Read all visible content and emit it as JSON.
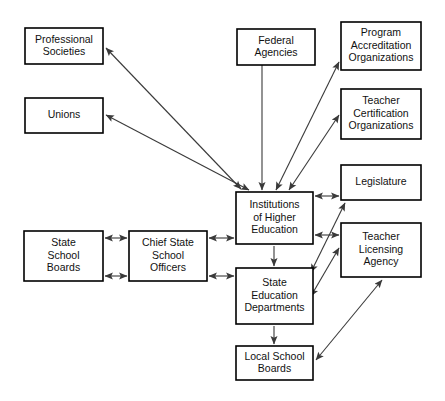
{
  "diagram": {
    "background_color": "#ffffff",
    "box_fill": "#ffffff",
    "box_stroke": "#000000",
    "edge_color": "#3a3a3a",
    "nodes": [
      {
        "id": "professional-societies",
        "label": "Professional Societies",
        "lines": [
          "Professional",
          "Societies"
        ],
        "x": 25,
        "y": 28,
        "w": 78,
        "h": 36
      },
      {
        "id": "unions",
        "label": "Unions",
        "lines": [
          "Unions"
        ],
        "x": 25,
        "y": 98,
        "w": 78,
        "h": 35
      },
      {
        "id": "federal-agencies",
        "label": "Federal Agencies",
        "lines": [
          "Federal",
          "Agencies"
        ],
        "x": 237,
        "y": 29,
        "w": 78,
        "h": 36
      },
      {
        "id": "program-accreditation-organizations",
        "label": "Program Accreditation Organizations",
        "lines": [
          "Program",
          "Accreditation",
          "Organizations"
        ],
        "x": 341,
        "y": 22,
        "w": 80,
        "h": 48
      },
      {
        "id": "teacher-certification-organizations",
        "label": "Teacher Certification Organizations",
        "lines": [
          "Teacher",
          "Certification",
          "Organizations"
        ],
        "x": 341,
        "y": 89,
        "w": 80,
        "h": 50
      },
      {
        "id": "legislature",
        "label": "Legislature",
        "lines": [
          "Legislature"
        ],
        "x": 341,
        "y": 165,
        "w": 80,
        "h": 35
      },
      {
        "id": "teacher-licensing-agency",
        "label": "Teacher Licensing Agency",
        "lines": [
          "Teacher",
          "Licensing",
          "Agency"
        ],
        "x": 341,
        "y": 223,
        "w": 80,
        "h": 54
      },
      {
        "id": "institutions-of-higher-education",
        "label": "Institutions of Higher Education",
        "lines": [
          "Institutions",
          "of Higher",
          "Education"
        ],
        "x": 236,
        "y": 192,
        "w": 77,
        "h": 52
      },
      {
        "id": "state-education-departments",
        "label": "State Education Departments",
        "lines": [
          "State",
          "Education",
          "Departments"
        ],
        "x": 236,
        "y": 268,
        "w": 77,
        "h": 56
      },
      {
        "id": "local-school-boards",
        "label": "Local School Boards",
        "lines": [
          "Local School",
          "Boards"
        ],
        "x": 236,
        "y": 346,
        "w": 77,
        "h": 34
      },
      {
        "id": "state-school-boards",
        "label": "State School Boards",
        "lines": [
          "State",
          "School",
          "Boards"
        ],
        "x": 24,
        "y": 231,
        "w": 79,
        "h": 50
      },
      {
        "id": "chief-state-school-officers",
        "label": "Chief State School Officers",
        "lines": [
          "Chief State",
          "School",
          "Officers"
        ],
        "x": 129,
        "y": 231,
        "w": 78,
        "h": 50
      }
    ],
    "edges": [
      {
        "id": "ihe-professional-societies",
        "from": "institutions-of-higher-education",
        "to": "professional-societies",
        "arrow": "both",
        "x1": 241,
        "y1": 189,
        "x2": 106,
        "y2": 48
      },
      {
        "id": "ihe-unions",
        "from": "institutions-of-higher-education",
        "to": "unions",
        "arrow": "both",
        "x1": 249,
        "y1": 190,
        "x2": 106,
        "y2": 115
      },
      {
        "id": "federal-agencies-ihe",
        "from": "federal-agencies",
        "to": "institutions-of-higher-education",
        "arrow": "end",
        "x1": 262,
        "y1": 65,
        "x2": 262,
        "y2": 190
      },
      {
        "id": "ihe-program-accreditation",
        "from": "institutions-of-higher-education",
        "to": "program-accreditation-organizations",
        "arrow": "both",
        "x1": 276,
        "y1": 190,
        "x2": 339,
        "y2": 62
      },
      {
        "id": "ihe-teacher-certification",
        "from": "institutions-of-higher-education",
        "to": "teacher-certification-organizations",
        "arrow": "both",
        "x1": 289,
        "y1": 190,
        "x2": 339,
        "y2": 115
      },
      {
        "id": "ihe-legislature",
        "from": "institutions-of-higher-education",
        "to": "legislature",
        "arrow": "both",
        "x1": 315,
        "y1": 196,
        "x2": 339,
        "y2": 196
      },
      {
        "id": "ihe-teacher-licensing",
        "from": "institutions-of-higher-education",
        "to": "teacher-licensing-agency",
        "arrow": "both",
        "x1": 315,
        "y1": 235,
        "x2": 339,
        "y2": 235
      },
      {
        "id": "ihe-state-education-departments",
        "from": "institutions-of-higher-education",
        "to": "state-education-departments",
        "arrow": "end",
        "x1": 274,
        "y1": 246,
        "x2": 274,
        "y2": 266
      },
      {
        "id": "sed-legislature",
        "from": "state-education-departments",
        "to": "legislature",
        "arrow": "both",
        "x1": 311,
        "y1": 272,
        "x2": 345,
        "y2": 203
      },
      {
        "id": "sed-teacher-licensing",
        "from": "state-education-departments",
        "to": "teacher-licensing-agency",
        "arrow": "both",
        "x1": 311,
        "y1": 296,
        "x2": 339,
        "y2": 248
      },
      {
        "id": "sed-local-school-boards",
        "from": "state-education-departments",
        "to": "local-school-boards",
        "arrow": "end",
        "x1": 274,
        "y1": 326,
        "x2": 274,
        "y2": 344
      },
      {
        "id": "local-school-boards-teacher-licensing",
        "from": "local-school-boards",
        "to": "teacher-licensing-agency",
        "arrow": "both",
        "x1": 316,
        "y1": 360,
        "x2": 382,
        "y2": 280
      },
      {
        "id": "ssb-csso-upper",
        "from": "state-school-boards",
        "to": "chief-state-school-officers",
        "arrow": "both",
        "x1": 105,
        "y1": 238,
        "x2": 127,
        "y2": 238
      },
      {
        "id": "ssb-csso-lower",
        "from": "state-school-boards",
        "to": "chief-state-school-officers",
        "arrow": "both",
        "x1": 105,
        "y1": 276,
        "x2": 127,
        "y2": 276
      },
      {
        "id": "csso-ihe",
        "from": "chief-state-school-officers",
        "to": "institutions-of-higher-education",
        "arrow": "both",
        "x1": 209,
        "y1": 238,
        "x2": 234,
        "y2": 238
      },
      {
        "id": "csso-sed",
        "from": "chief-state-school-officers",
        "to": "state-education-departments",
        "arrow": "both",
        "x1": 209,
        "y1": 276,
        "x2": 234,
        "y2": 276
      }
    ]
  }
}
